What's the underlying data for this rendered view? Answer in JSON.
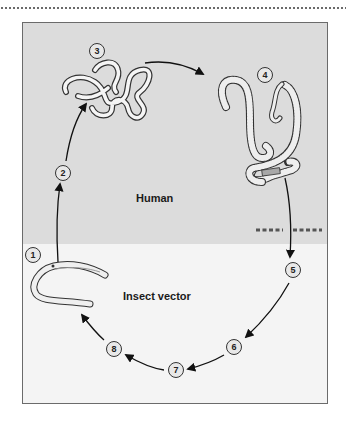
{
  "diagram": {
    "zones": {
      "human": {
        "label": "Human",
        "color": "#dcdcdc"
      },
      "insect": {
        "label": "Insect vector",
        "color": "#f4f4f4"
      }
    },
    "stages": [
      {
        "n": "1",
        "x": 33,
        "y": 255
      },
      {
        "n": "2",
        "x": 63,
        "y": 173
      },
      {
        "n": "3",
        "x": 97,
        "y": 51
      },
      {
        "n": "4",
        "x": 265,
        "y": 75
      },
      {
        "n": "5",
        "x": 293,
        "y": 270
      },
      {
        "n": "6",
        "x": 234,
        "y": 347
      },
      {
        "n": "7",
        "x": 176,
        "y": 370
      },
      {
        "n": "8",
        "x": 114,
        "y": 349
      }
    ],
    "cycle_order": [
      "1",
      "2",
      "3",
      "4",
      "5",
      "6",
      "7",
      "8",
      "1"
    ],
    "boundary_marker": "dashed line between human and insect zones"
  }
}
